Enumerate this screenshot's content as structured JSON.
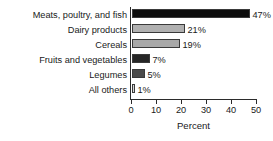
{
  "chart_data": {
    "type": "bar",
    "orientation": "horizontal",
    "title": "",
    "subtitle": "",
    "xlabel": "Percent",
    "ylabel": "",
    "xlim": [
      0,
      50
    ],
    "xticks": [
      0,
      10,
      20,
      30,
      40,
      50
    ],
    "xtick_labels": [
      "0",
      "10",
      "20",
      "30",
      "40",
      "50"
    ],
    "grid": false,
    "legend": "none",
    "categories": [
      "Meats, poultry, and fish",
      "Dairy products",
      "Cereals",
      "Fruits and vegetables",
      "Legumes",
      "All others"
    ],
    "values": [
      47,
      21,
      19,
      7,
      5,
      1
    ],
    "data_labels": [
      "47%",
      "21%",
      "19%",
      "7%",
      "5%",
      "1%"
    ],
    "bar_colors": [
      "#0d0d0d",
      "#b0b0b0",
      "#a8a8a8",
      "#262626",
      "#4a4a4a",
      "#d6d6d6"
    ],
    "bar_outline_color": "#3a3a3a"
  },
  "axis": {
    "x_title": "Percent",
    "tick_labels": [
      "0",
      "10",
      "20",
      "30",
      "40",
      "50"
    ]
  },
  "rows": [
    {
      "label": "Meats, poultry, and fish",
      "value": 47,
      "data_label": "47%",
      "color": "#0d0d0d"
    },
    {
      "label": "Dairy products",
      "value": 21,
      "data_label": "21%",
      "color": "#b0b0b0"
    },
    {
      "label": "Cereals",
      "value": 19,
      "data_label": "19%",
      "color": "#a8a8a8"
    },
    {
      "label": "Fruits and vegetables",
      "value": 7,
      "data_label": "7%",
      "color": "#262626"
    },
    {
      "label": "Legumes",
      "value": 5,
      "data_label": "5%",
      "color": "#4a4a4a"
    },
    {
      "label": "All others",
      "value": 1,
      "data_label": "1%",
      "color": "#d6d6d6"
    }
  ]
}
